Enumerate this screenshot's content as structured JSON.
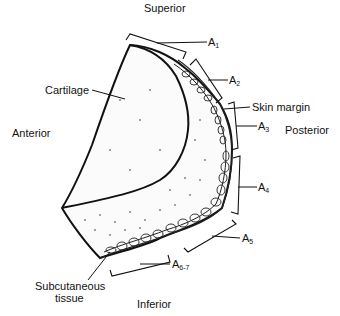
{
  "orientation": {
    "top": "Superior",
    "bottom": "Inferior",
    "left": "Anterior",
    "right": "Posterior"
  },
  "structures": {
    "cartilage": "Cartilage",
    "skin_margin": "Skin margin",
    "subcutaneous_line1": "Subcutaneous",
    "subcutaneous_line2": "tissue"
  },
  "zones": [
    {
      "base": "A",
      "sub": "1"
    },
    {
      "base": "A",
      "sub": "2"
    },
    {
      "base": "A",
      "sub": "3"
    },
    {
      "base": "A",
      "sub": "4"
    },
    {
      "base": "A",
      "sub": "5"
    },
    {
      "base": "A",
      "sub": "6-7"
    }
  ]
}
